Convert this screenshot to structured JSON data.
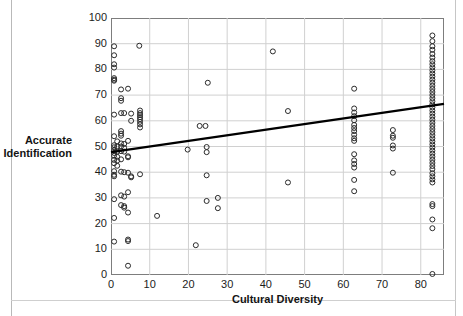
{
  "figure": {
    "background": "#ffffff",
    "frame_color": "#7d7d7d",
    "grid_color": "#d0d0d0",
    "marker_color": "#2b2b2b",
    "trend_color": "#000000"
  },
  "chart_data": {
    "type": "scatter",
    "title": "",
    "xlabel": "Cultural Diversity",
    "ylabel": "Accurate Identification",
    "ylabel_line1": "Accurate",
    "ylabel_line2": "Identification",
    "xlim": [
      0,
      86
    ],
    "ylim": [
      0,
      100
    ],
    "xticks": [
      0,
      10,
      20,
      30,
      40,
      50,
      60,
      70,
      80
    ],
    "yticks": [
      0,
      10,
      20,
      30,
      40,
      50,
      60,
      70,
      80,
      90,
      100
    ],
    "grid": true,
    "grid_axes": "both",
    "legend": false,
    "marker": "open-circle",
    "marker_size": 5,
    "trendline": {
      "type": "linear",
      "x_start": 0,
      "y_start": 47.8,
      "x_end": 86,
      "y_end": 66.6,
      "slope": 0.219,
      "intercept": 47.8,
      "width": 2.4,
      "color": "#000000"
    },
    "points": [
      [
        0.8,
        89.0
      ],
      [
        0.8,
        85.5
      ],
      [
        0.8,
        82.0
      ],
      [
        0.8,
        80.7
      ],
      [
        0.8,
        76.6
      ],
      [
        0.8,
        76.0
      ],
      [
        0.8,
        75.6
      ],
      [
        0.8,
        62.4
      ],
      [
        0.8,
        54.0
      ],
      [
        0.8,
        50.5
      ],
      [
        0.8,
        49.7
      ],
      [
        0.8,
        48.5
      ],
      [
        0.8,
        47.5
      ],
      [
        0.8,
        46.4
      ],
      [
        0.8,
        44.8
      ],
      [
        0.8,
        43.5
      ],
      [
        0.8,
        40.4
      ],
      [
        0.8,
        39.0
      ],
      [
        0.8,
        38.4
      ],
      [
        0.8,
        29.5
      ],
      [
        0.8,
        22.2
      ],
      [
        0.8,
        13.0
      ],
      [
        1.6,
        52.0
      ],
      [
        1.6,
        50.0
      ],
      [
        1.6,
        48.0
      ],
      [
        1.6,
        46.0
      ],
      [
        1.6,
        44.5
      ],
      [
        1.6,
        42.5
      ],
      [
        2.6,
        72.2
      ],
      [
        2.6,
        68.8
      ],
      [
        2.6,
        67.8
      ],
      [
        2.6,
        63.0
      ],
      [
        2.6,
        56.0
      ],
      [
        2.6,
        55.0
      ],
      [
        2.6,
        54.2
      ],
      [
        2.6,
        51.2
      ],
      [
        2.6,
        50.0
      ],
      [
        2.6,
        48.2
      ],
      [
        2.6,
        45.0
      ],
      [
        2.6,
        40.2
      ],
      [
        2.6,
        31.0
      ],
      [
        2.6,
        27.2
      ],
      [
        3.4,
        63.0
      ],
      [
        3.4,
        51.0
      ],
      [
        3.4,
        49.5
      ],
      [
        3.4,
        48.0
      ],
      [
        3.4,
        40.0
      ],
      [
        3.4,
        30.5
      ],
      [
        3.4,
        26.8
      ],
      [
        3.4,
        26.2
      ],
      [
        4.4,
        72.5
      ],
      [
        4.4,
        52.2
      ],
      [
        4.4,
        46.2
      ],
      [
        4.4,
        45.8
      ],
      [
        4.4,
        39.8
      ],
      [
        4.4,
        32.2
      ],
      [
        4.4,
        24.3
      ],
      [
        4.4,
        13.8
      ],
      [
        4.4,
        13.2
      ],
      [
        4.4,
        3.6
      ],
      [
        5.2,
        62.8
      ],
      [
        5.2,
        60.0
      ],
      [
        5.2,
        38.4
      ],
      [
        5.2,
        38.0
      ],
      [
        7.3,
        89.2
      ],
      [
        7.5,
        64.0
      ],
      [
        7.5,
        63.0
      ],
      [
        7.5,
        62.2
      ],
      [
        7.5,
        61.4
      ],
      [
        7.5,
        60.6
      ],
      [
        7.5,
        59.6
      ],
      [
        7.5,
        58.6
      ],
      [
        7.5,
        57.4
      ],
      [
        7.5,
        39.2
      ],
      [
        11.9,
        23.0
      ],
      [
        19.8,
        48.8
      ],
      [
        21.9,
        11.6
      ],
      [
        22.9,
        58.0
      ],
      [
        24.4,
        58.0
      ],
      [
        24.7,
        49.8
      ],
      [
        24.7,
        47.8
      ],
      [
        24.7,
        38.8
      ],
      [
        24.7,
        28.8
      ],
      [
        25.0,
        74.8
      ],
      [
        27.6,
        30.0
      ],
      [
        27.6,
        26.0
      ],
      [
        41.8,
        87.0
      ],
      [
        45.7,
        63.8
      ],
      [
        45.7,
        36.0
      ],
      [
        62.8,
        72.5
      ],
      [
        62.8,
        64.8
      ],
      [
        62.8,
        63.2
      ],
      [
        62.8,
        61.8
      ],
      [
        62.8,
        60.2
      ],
      [
        62.8,
        58.4
      ],
      [
        62.8,
        57.2
      ],
      [
        62.8,
        56.0
      ],
      [
        62.8,
        54.6
      ],
      [
        62.8,
        53.2
      ],
      [
        62.8,
        52.2
      ],
      [
        62.8,
        47.0
      ],
      [
        62.8,
        44.6
      ],
      [
        62.8,
        43.2
      ],
      [
        62.8,
        41.8
      ],
      [
        62.8,
        37.0
      ],
      [
        62.8,
        32.6
      ],
      [
        72.8,
        56.4
      ],
      [
        72.8,
        54.2
      ],
      [
        72.8,
        53.4
      ],
      [
        72.8,
        50.4
      ],
      [
        72.8,
        49.2
      ],
      [
        72.8,
        39.8
      ],
      [
        83.0,
        93.2
      ],
      [
        83.0,
        91.0
      ],
      [
        83.0,
        89.0
      ],
      [
        83.0,
        87.6
      ],
      [
        83.0,
        86.0
      ],
      [
        83.0,
        84.6
      ],
      [
        83.0,
        83.2
      ],
      [
        83.0,
        82.0
      ],
      [
        83.0,
        80.8
      ],
      [
        83.0,
        79.6
      ],
      [
        83.0,
        78.4
      ],
      [
        83.0,
        77.2
      ],
      [
        83.0,
        76.0
      ],
      [
        83.0,
        74.8
      ],
      [
        83.0,
        73.6
      ],
      [
        83.0,
        72.4
      ],
      [
        83.0,
        71.2
      ],
      [
        83.0,
        70.0
      ],
      [
        83.0,
        68.8
      ],
      [
        83.0,
        67.6
      ],
      [
        83.0,
        66.4
      ],
      [
        83.0,
        65.2
      ],
      [
        83.0,
        64.0
      ],
      [
        83.0,
        62.8
      ],
      [
        83.0,
        61.6
      ],
      [
        83.0,
        60.4
      ],
      [
        83.0,
        59.2
      ],
      [
        83.0,
        58.0
      ],
      [
        83.0,
        56.8
      ],
      [
        83.0,
        55.6
      ],
      [
        83.0,
        54.4
      ],
      [
        83.0,
        53.2
      ],
      [
        83.0,
        52.0
      ],
      [
        83.0,
        50.8
      ],
      [
        83.0,
        49.6
      ],
      [
        83.0,
        48.4
      ],
      [
        83.0,
        47.2
      ],
      [
        83.0,
        46.0
      ],
      [
        83.0,
        44.8
      ],
      [
        83.0,
        43.6
      ],
      [
        83.0,
        42.4
      ],
      [
        83.0,
        41.2
      ],
      [
        83.0,
        39.6
      ],
      [
        83.0,
        38.4
      ],
      [
        83.0,
        37.2
      ],
      [
        83.0,
        36.0
      ],
      [
        83.0,
        27.6
      ],
      [
        83.0,
        26.8
      ],
      [
        83.0,
        21.6
      ],
      [
        83.0,
        18.2
      ],
      [
        83.0,
        0.4
      ]
    ]
  },
  "caption": {
    "text": ""
  }
}
